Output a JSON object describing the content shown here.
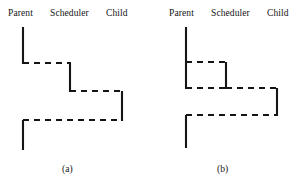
{
  "figure": {
    "stroke_color": "#151515",
    "background_color": "#ffffff",
    "panels": [
      {
        "id": "a",
        "caption": "(a)",
        "caption_x": 62,
        "caption_y": 164,
        "columns": [
          {
            "name": "Parent",
            "label": "Parent",
            "x": 8,
            "y": 8
          },
          {
            "name": "Scheduler",
            "label": "Scheduler",
            "x": 50,
            "y": 8
          },
          {
            "name": "Child",
            "label": "Child",
            "x": 106,
            "y": 8
          }
        ],
        "segments": [
          {
            "name": "parent-active-1",
            "type": "solid",
            "x1": 23,
            "y1": 27,
            "x2": 23,
            "y2": 64
          },
          {
            "name": "parent-to-scheduler-1",
            "type": "dashed",
            "x1": 23,
            "y1": 63,
            "x2": 71,
            "y2": 63
          },
          {
            "name": "scheduler-active-1",
            "type": "solid",
            "x1": 70,
            "y1": 63,
            "x2": 70,
            "y2": 92
          },
          {
            "name": "scheduler-to-child",
            "type": "dashed",
            "x1": 70,
            "y1": 91,
            "x2": 123,
            "y2": 91
          },
          {
            "name": "child-active",
            "type": "solid",
            "x1": 122,
            "y1": 91,
            "x2": 122,
            "y2": 121
          },
          {
            "name": "child-to-parent",
            "type": "dashed",
            "x1": 23,
            "y1": 120,
            "x2": 123,
            "y2": 120
          },
          {
            "name": "parent-active-2",
            "type": "solid",
            "x1": 23,
            "y1": 120,
            "x2": 23,
            "y2": 150
          }
        ]
      },
      {
        "id": "b",
        "caption": "(b)",
        "caption_x": 68,
        "caption_y": 164,
        "columns": [
          {
            "name": "Parent",
            "label": "Parent",
            "x": 20,
            "y": 8
          },
          {
            "name": "Scheduler",
            "label": "Scheduler",
            "x": 62,
            "y": 8
          },
          {
            "name": "Child",
            "label": "Child",
            "x": 118,
            "y": 8
          }
        ],
        "segments": [
          {
            "name": "parent-active-1",
            "type": "solid",
            "x1": 37,
            "y1": 27,
            "x2": 37,
            "y2": 89
          },
          {
            "name": "parent-to-scheduler-1",
            "type": "dashed",
            "x1": 37,
            "y1": 62,
            "x2": 78,
            "y2": 62
          },
          {
            "name": "scheduler-active-1",
            "type": "solid",
            "x1": 77,
            "y1": 62,
            "x2": 77,
            "y2": 89
          },
          {
            "name": "scheduler-to-parent",
            "type": "dashed",
            "x1": 37,
            "y1": 88,
            "x2": 78,
            "y2": 88
          },
          {
            "name": "scheduler-to-child",
            "type": "dashed",
            "x1": 77,
            "y1": 88,
            "x2": 129,
            "y2": 88
          },
          {
            "name": "child-active",
            "type": "solid",
            "x1": 128,
            "y1": 88,
            "x2": 128,
            "y2": 116
          },
          {
            "name": "child-to-parent",
            "type": "dashed",
            "x1": 37,
            "y1": 115,
            "x2": 129,
            "y2": 115
          },
          {
            "name": "parent-active-2",
            "type": "solid",
            "x1": 37,
            "y1": 115,
            "x2": 37,
            "y2": 148
          }
        ]
      }
    ]
  }
}
